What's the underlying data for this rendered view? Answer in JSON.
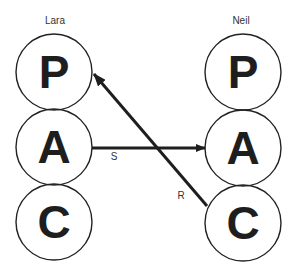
{
  "diagram": {
    "title": "",
    "persons": [
      {
        "name": "Lara",
        "states": [
          {
            "letter": "P"
          },
          {
            "letter": "A"
          },
          {
            "letter": "C"
          }
        ]
      },
      {
        "name": "Neil",
        "states": [
          {
            "letter": "P"
          },
          {
            "letter": "A"
          },
          {
            "letter": "C"
          }
        ]
      }
    ],
    "transactions": [
      {
        "label": "S",
        "from": "Lara.A",
        "to": "Neil.A"
      },
      {
        "label": "R",
        "from": "Neil.C",
        "to": "Lara.P"
      }
    ],
    "colors": {
      "stroke": "#222222",
      "text": "#1e1e1e",
      "background": "#ffffff"
    }
  }
}
